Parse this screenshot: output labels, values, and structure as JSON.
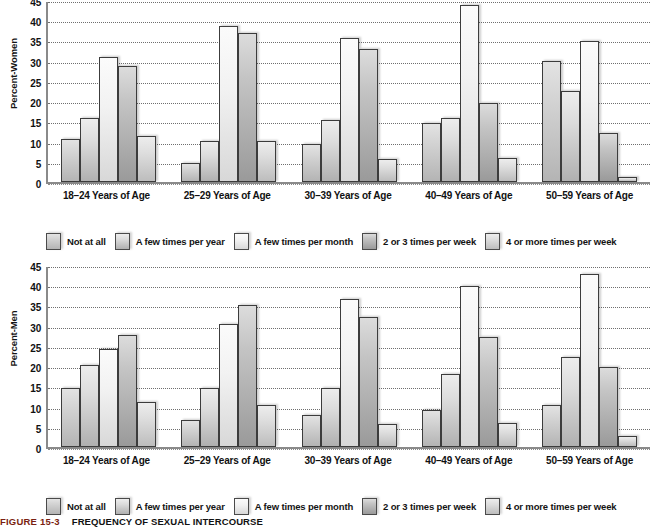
{
  "caption": {
    "number": "FIGURE 15-3",
    "title": "FREQUENCY OF SEXUAL INTERCOURSE"
  },
  "legend": {
    "items": [
      {
        "label": "Not at all",
        "swatch": "legend-swatch-not-at-all"
      },
      {
        "label": "A few times per year",
        "swatch": "legend-swatch-few-per-year"
      },
      {
        "label": "A few times per month",
        "swatch": "legend-swatch-few-per-month"
      },
      {
        "label": "2 or 3 times per week",
        "swatch": "legend-swatch-2-3-per-week"
      },
      {
        "label": "4 or more times per week",
        "swatch": "legend-swatch-4-plus-per-week"
      }
    ]
  },
  "chart_data": [
    {
      "type": "bar",
      "title": "Percent-Women",
      "ylabel": "Percent-Women",
      "xlabel": "",
      "ylim": [
        0,
        45
      ],
      "yticks": [
        0,
        5,
        10,
        15,
        20,
        25,
        30,
        35,
        40,
        45
      ],
      "grid": true,
      "legend_position": "bottom",
      "categories": [
        "18–24 Years of Age",
        "25–29 Years of Age",
        "30–39 Years of Age",
        "40–49 Years of Age",
        "50–59 Years of Age"
      ],
      "series": [
        {
          "name": "Not at all",
          "values": [
            10.7,
            4.7,
            9.3,
            14.6,
            30.0
          ]
        },
        {
          "name": "A few times per year",
          "values": [
            15.8,
            10.2,
            15.3,
            15.8,
            22.5
          ]
        },
        {
          "name": "A few times per month",
          "values": [
            31.0,
            38.5,
            35.7,
            43.8,
            34.8
          ]
        },
        {
          "name": "2 or 3 times per week",
          "values": [
            28.7,
            36.8,
            33.0,
            19.5,
            12.0
          ]
        },
        {
          "name": "4 or more times per week",
          "values": [
            11.5,
            10.2,
            5.7,
            6.0,
            1.3
          ]
        }
      ]
    },
    {
      "type": "bar",
      "title": "Percent-Men",
      "ylabel": "Percent-Men",
      "xlabel": "",
      "ylim": [
        0,
        45
      ],
      "yticks": [
        0,
        5,
        10,
        15,
        20,
        25,
        30,
        35,
        40,
        45
      ],
      "grid": true,
      "legend_position": "bottom",
      "categories": [
        "18–24 Years of Age",
        "25–29 Years of Age",
        "30–39 Years of Age",
        "40–49 Years of Age",
        "50–59 Years of Age"
      ],
      "series": [
        {
          "name": "Not at all",
          "values": [
            14.7,
            6.8,
            7.8,
            9.2,
            10.5
          ]
        },
        {
          "name": "A few times per year",
          "values": [
            20.2,
            14.7,
            14.5,
            18.0,
            22.2
          ]
        },
        {
          "name": "A few times per month",
          "values": [
            24.2,
            30.3,
            36.7,
            39.8,
            42.8
          ]
        },
        {
          "name": "2 or 3 times per week",
          "values": [
            27.7,
            35.2,
            32.2,
            27.2,
            19.8
          ]
        },
        {
          "name": "4 or more times per week",
          "values": [
            11.2,
            10.3,
            5.8,
            6.0,
            2.8
          ]
        }
      ]
    }
  ]
}
